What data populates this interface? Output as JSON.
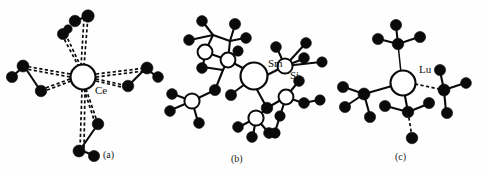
{
  "figure": {
    "background_color": "#fefefe",
    "ink_color": "#0a0a0a",
    "panels": [
      {
        "id": "a",
        "caption": "(a)",
        "center_label": "Ce",
        "center_type": "open-circle",
        "bond_style": "dashed",
        "description": "Ce central atom with four dashed-bond arms each terminating in a cluster of filled circles"
      },
      {
        "id": "b",
        "caption": "(b)",
        "center_label": "Sm",
        "secondary_label": "Si",
        "center_type": "open-circle",
        "bond_style": "solid",
        "description": "Sm central atom bonded to several Si open circles each bearing filled methyl carbons"
      },
      {
        "id": "c",
        "caption": "(c)",
        "center_label": "Lu",
        "center_type": "open-circle",
        "bond_style": "solid",
        "description": "Lu central atom with four substituent groups radiating outward"
      }
    ]
  },
  "labels": {
    "ce": "Ce",
    "sm": "Sm",
    "si": "Si",
    "lu": "Lu",
    "caption_a": "(a)",
    "caption_b": "(b)",
    "caption_c": "(c)"
  }
}
